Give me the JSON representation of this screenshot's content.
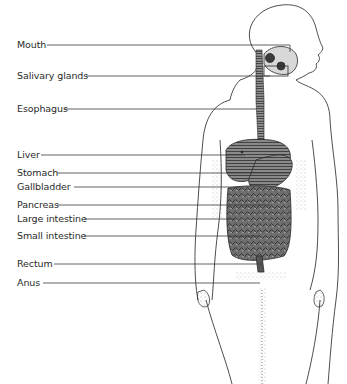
{
  "diagram": {
    "colors": {
      "background": "#ffffff",
      "line": "#3a3a3a",
      "organ_fill": "#6a6a6a",
      "organ_dark": "#3c3c3c",
      "text": "#2a2a2a"
    },
    "labels": [
      {
        "id": "mouth",
        "text": "Mouth",
        "y": 45,
        "line_from_x": 47,
        "line_to_x": 290
      },
      {
        "id": "salivary-glands",
        "text": "Salivary glands",
        "y": 76,
        "line_from_x": 86,
        "line_to_x": 270
      },
      {
        "id": "esophagus",
        "text": "Esophagus",
        "y": 109,
        "line_from_x": 64,
        "line_to_x": 256
      },
      {
        "id": "liver",
        "text": "Liver",
        "y": 155,
        "line_from_x": 41,
        "line_to_x": 245
      },
      {
        "id": "stomach",
        "text": "Stomach",
        "y": 173,
        "line_from_x": 57,
        "line_to_x": 290
      },
      {
        "id": "gallbladder",
        "text": "Gallbladder",
        "y": 187,
        "line_from_x": 74,
        "line_to_x": 240
      },
      {
        "id": "pancreas",
        "text": "Pancreas",
        "y": 205,
        "line_from_x": 57,
        "line_to_x": 270
      },
      {
        "id": "large-intestine",
        "text": "Large intestine",
        "y": 219,
        "line_from_x": 84,
        "line_to_x": 235
      },
      {
        "id": "small-intestine",
        "text": "Small intestine",
        "y": 236,
        "line_from_x": 84,
        "line_to_x": 260
      },
      {
        "id": "rectum",
        "text": "Rectum",
        "y": 264,
        "line_from_x": 54,
        "line_to_x": 262
      },
      {
        "id": "anus",
        "text": "Anus",
        "y": 283,
        "line_from_x": 43,
        "line_to_x": 260
      }
    ]
  }
}
